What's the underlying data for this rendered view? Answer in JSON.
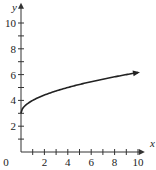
{
  "chart_data": {
    "type": "line",
    "title": "",
    "xlabel": "x",
    "ylabel": "y",
    "xlim": [
      0,
      10.5
    ],
    "ylim": [
      0,
      11.5
    ],
    "x_ticks_major": [
      0,
      2,
      4,
      6,
      8,
      10
    ],
    "x_ticks_minor": [
      1,
      3,
      5,
      7,
      9
    ],
    "y_ticks_major": [
      2,
      4,
      6,
      8,
      10
    ],
    "y_ticks_minor": [
      1,
      3,
      5,
      7,
      9
    ],
    "x_tick_labels": [
      "0",
      "2",
      "4",
      "6",
      "8",
      "10"
    ],
    "y_tick_labels": [
      "2",
      "4",
      "6",
      "8",
      "10"
    ],
    "grid": false,
    "legend": null,
    "series": [
      {
        "name": "y = 3 + √x",
        "x": [
          0,
          0.25,
          0.5,
          1,
          2,
          3,
          4,
          5,
          6,
          7,
          8,
          9,
          10
        ],
        "values": [
          3,
          3.5,
          3.71,
          4,
          4.41,
          4.73,
          5,
          5.24,
          5.45,
          5.65,
          5.83,
          6,
          6.16
        ],
        "end_arrow": true,
        "color": "#222222"
      }
    ]
  }
}
